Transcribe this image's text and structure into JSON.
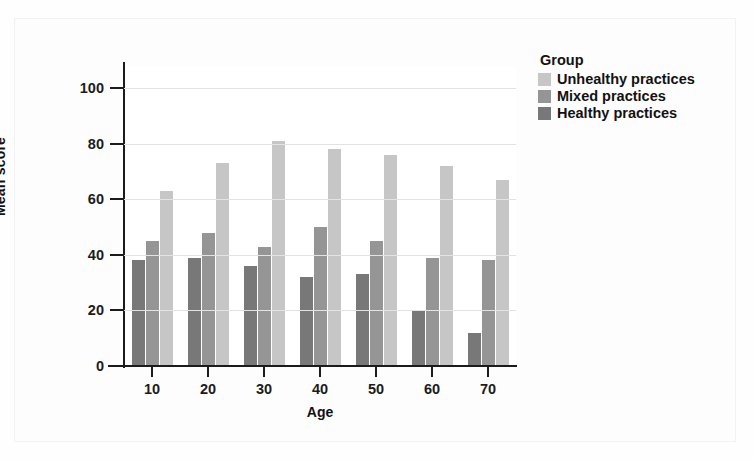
{
  "chart_data": {
    "type": "bar",
    "title": "",
    "xlabel": "Age",
    "ylabel": "Mean score",
    "categories": [
      "10",
      "20",
      "30",
      "40",
      "50",
      "60",
      "70"
    ],
    "yticks": [
      0,
      20,
      40,
      60,
      80,
      100
    ],
    "ylim": [
      0,
      108
    ],
    "grid": true,
    "legend_position": "right",
    "legend_title": "Group",
    "series": [
      {
        "name": "Unhealthy practices",
        "color": "#c6c6c6",
        "values": [
          63,
          73,
          81,
          78,
          76,
          72,
          67
        ]
      },
      {
        "name": "Mixed practices",
        "color": "#959595",
        "values": [
          45,
          48,
          43,
          50,
          45,
          39,
          38
        ]
      },
      {
        "name": "Healthy practices",
        "color": "#787878",
        "values": [
          38,
          39,
          36,
          32,
          33,
          20,
          12
        ]
      }
    ],
    "series_draw_order": [
      "Healthy practices",
      "Mixed practices",
      "Unhealthy practices"
    ]
  },
  "legend": {
    "title": "Group",
    "items": [
      {
        "label": "Unhealthy practices",
        "color": "#c6c6c6"
      },
      {
        "label": "Mixed practices",
        "color": "#959595"
      },
      {
        "label": "Healthy practices",
        "color": "#787878"
      }
    ]
  },
  "axes": {
    "y_label": "Mean score",
    "x_label": "Age",
    "y_tick_labels": [
      "100",
      "80",
      "60",
      "40",
      "20",
      "0"
    ],
    "x_tick_labels": [
      "10",
      "20",
      "30",
      "40",
      "50",
      "60",
      "70"
    ]
  },
  "colors": {
    "background": "#fefefe",
    "plot_background": "#ffffff",
    "axis": "#1b1b1b",
    "grid": "#e3e3e3",
    "text": "#111111"
  }
}
